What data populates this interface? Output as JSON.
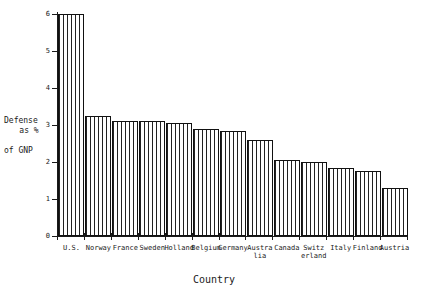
{
  "chart_data": {
    "type": "bar",
    "title": "",
    "xlabel": "Country",
    "ylabel": "Defense as % of GNP",
    "ylabel_lines": [
      "Defense",
      "as %",
      "of GNP"
    ],
    "categories": [
      "U.S.",
      "Norway",
      "France",
      "Sweden",
      "Holland",
      "Belgium",
      "Germany",
      "Austra\nlia",
      "Canada",
      "Switz\nerland",
      "Italy",
      "Finland",
      "Austria"
    ],
    "values": [
      6.0,
      3.25,
      3.1,
      3.1,
      3.05,
      2.9,
      2.85,
      2.6,
      2.05,
      2.0,
      1.85,
      1.75,
      1.3
    ],
    "ylim": [
      0,
      6
    ],
    "yticks": [
      0,
      1,
      2,
      3,
      4,
      5,
      6
    ],
    "ytick_labels": [
      "0",
      "1",
      "2",
      "3",
      "4",
      "5",
      "6"
    ],
    "grid": false,
    "legend": null,
    "bar_fill": "vertical-hatch",
    "bar_edge_color": "#111111",
    "background_color": "#ffffff",
    "text_color": "#1a1a1a"
  }
}
